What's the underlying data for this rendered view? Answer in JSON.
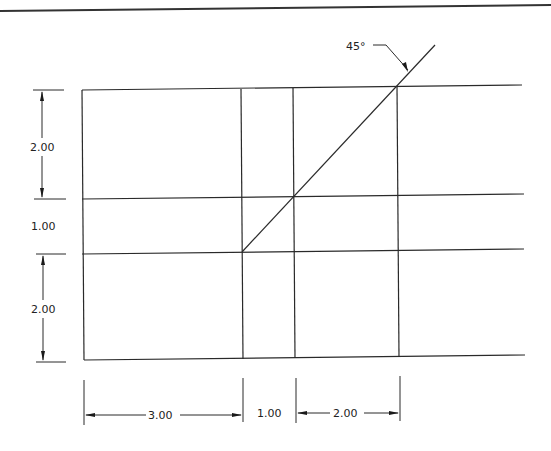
{
  "drawing": {
    "angle_label": "45°",
    "vertical_dimensions": [
      {
        "label": "2.00"
      },
      {
        "label": "1.00"
      },
      {
        "label": "2.00"
      }
    ],
    "horizontal_dimensions": [
      {
        "label": "3.00"
      },
      {
        "label": "1.00"
      },
      {
        "label": "2.00"
      }
    ],
    "line_color": "#2a2a2a",
    "background": "#ffffff"
  }
}
